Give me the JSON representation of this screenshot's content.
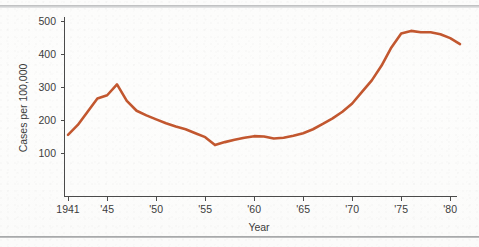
{
  "chart_data": {
    "type": "line",
    "title": "",
    "xlabel": "Year",
    "ylabel": "Cases per 100,000",
    "xlim": [
      1941,
      1981
    ],
    "ylim": [
      0,
      520
    ],
    "grid": false,
    "legend": "none",
    "line_color": "#c2572f",
    "axis_color": "#4a4a4a",
    "background_color": "#fdfdfc",
    "y_ticks": [
      100,
      200,
      300,
      400,
      500
    ],
    "y_tick_labels": [
      "100",
      "200",
      "300",
      "400",
      "500"
    ],
    "x_ticks": [
      1941,
      1945,
      1950,
      1955,
      1960,
      1965,
      1970,
      1975,
      1980
    ],
    "x_tick_labels": [
      "1941",
      "'45",
      "'50",
      "'55",
      "'60",
      "'65",
      "'70",
      "'75",
      "'80"
    ],
    "x": [
      1941,
      1942,
      1943,
      1944,
      1945,
      1946,
      1947,
      1948,
      1949,
      1950,
      1951,
      1952,
      1953,
      1954,
      1955,
      1956,
      1957,
      1958,
      1959,
      1960,
      1961,
      1962,
      1963,
      1964,
      1965,
      1966,
      1967,
      1968,
      1969,
      1970,
      1971,
      1972,
      1973,
      1974,
      1975,
      1976,
      1977,
      1978,
      1979,
      1980,
      1981
    ],
    "values": [
      155,
      185,
      225,
      265,
      275,
      308,
      258,
      228,
      214,
      202,
      190,
      180,
      172,
      160,
      148,
      124,
      133,
      140,
      146,
      151,
      150,
      144,
      146,
      152,
      160,
      172,
      188,
      205,
      225,
      250,
      285,
      320,
      365,
      420,
      462,
      470,
      466,
      466,
      460,
      448,
      430
    ],
    "series": [
      {
        "name": "Cases per 100,000",
        "values": [
          155,
          185,
          225,
          265,
          275,
          308,
          258,
          228,
          214,
          202,
          190,
          180,
          172,
          160,
          148,
          124,
          133,
          140,
          146,
          151,
          150,
          144,
          146,
          152,
          160,
          172,
          188,
          205,
          225,
          250,
          285,
          320,
          365,
          420,
          462,
          470,
          466,
          466,
          460,
          448,
          430
        ]
      }
    ],
    "annotations": []
  }
}
